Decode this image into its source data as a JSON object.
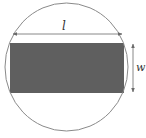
{
  "diagram": {
    "labels": {
      "length": "l",
      "width": "w"
    },
    "colors": {
      "background": "#ffffff",
      "circle_stroke": "#8a8a8a",
      "rectangle_fill": "#5f5f5f",
      "dimension_line": "#7a7a7a",
      "label_text": "#333333"
    },
    "shapes": {
      "circle": {
        "cx": 66.5,
        "cy": 67,
        "rx": 61.5,
        "ry": 64
      },
      "rectangle": {
        "x": 10,
        "y": 43,
        "width": 114,
        "height": 50
      },
      "length_dimension": {
        "x1": 13,
        "y1": 34,
        "x2": 122,
        "y2": 34
      },
      "width_dimension": {
        "x1": 133,
        "y1": 44,
        "x2": 133,
        "y2": 92
      }
    }
  }
}
